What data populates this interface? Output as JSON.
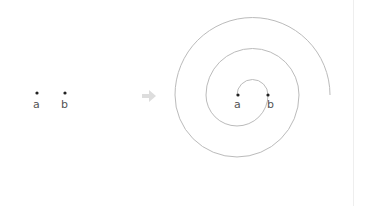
{
  "diagram": {
    "left_panel": {
      "points": [
        {
          "label": "a",
          "x": 37,
          "y": 95
        },
        {
          "label": "b",
          "x": 65,
          "y": 95
        }
      ]
    },
    "arrow": {
      "direction": "right",
      "color": "#dddddd"
    },
    "right_panel": {
      "points": [
        {
          "label": "a",
          "x": 237,
          "y": 95
        },
        {
          "label": "b",
          "x": 268,
          "y": 95
        }
      ],
      "spiral": {
        "stroke": "#bbbbbb",
        "turns": "semicircle spiral from a outward, ending at right"
      }
    },
    "colors": {
      "point": "#222222",
      "label": "#555555"
    }
  }
}
